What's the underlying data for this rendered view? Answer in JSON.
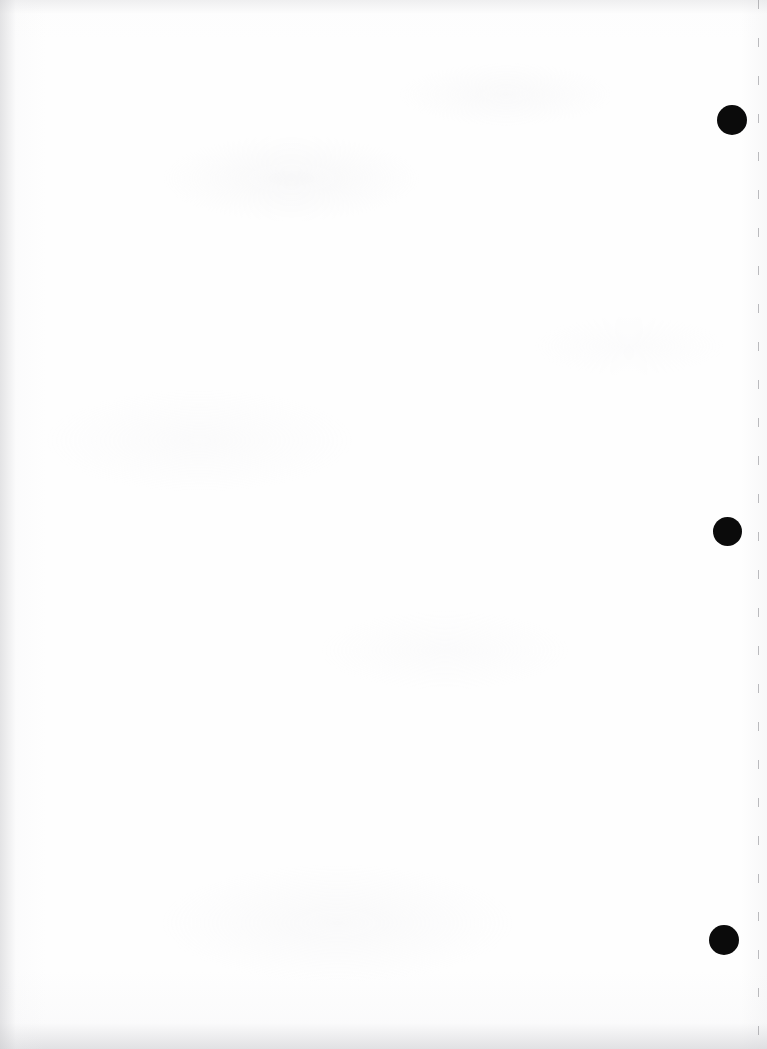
{
  "page": {
    "kind": "scanned-blank-page",
    "width": 767,
    "height": 1049,
    "background_color": "#fefefe",
    "paper_tone": "#fdfdfd",
    "visible_text": "",
    "note": ""
  },
  "marks": {
    "ink_color": "#0b0b0b",
    "registration_dots": [
      {
        "name": "registration-dot-top",
        "cx": 732,
        "cy": 120,
        "diameter": 30
      },
      {
        "name": "registration-dot-middle",
        "cx": 727,
        "cy": 531,
        "diameter": 29
      },
      {
        "name": "registration-dot-bottom",
        "cx": 724,
        "cy": 940,
        "diameter": 30
      }
    ],
    "perforation": {
      "name": "perforation-line",
      "x": 758,
      "dash_length": 9,
      "dash_gap": 29,
      "color": "#78787e"
    }
  },
  "scan_artifacts": {
    "left_edge_shadow": "#cdcdd0",
    "bottom_edge_shadow": "#cecece",
    "top_edge_shadow": "#d8d8db",
    "grain_tint": "#e6e6ea"
  }
}
